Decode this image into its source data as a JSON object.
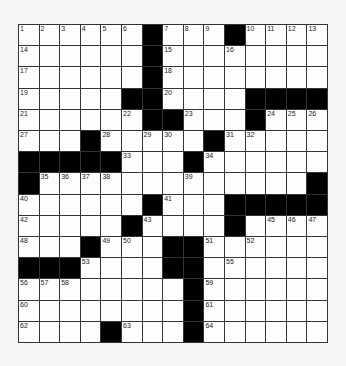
{
  "puzzle": {
    "rows": 15,
    "cols": 15,
    "layout": [
      "......#...#....",
      "......#........",
      "......#........",
      ".....##....####",
      "......##...#...",
      "...#.....#.....",
      "#####...#......",
      "#.............#",
      "......#...#####",
      ".....#....#....",
      "...#...##......",
      "###....##......",
      "........#......",
      "........#......",
      "....#...#......"
    ],
    "numbers": [
      [
        0,
        0,
        "1"
      ],
      [
        0,
        1,
        "2"
      ],
      [
        0,
        2,
        "3"
      ],
      [
        0,
        3,
        "4"
      ],
      [
        0,
        4,
        "5"
      ],
      [
        0,
        5,
        "6"
      ],
      [
        0,
        7,
        "7"
      ],
      [
        0,
        8,
        "8"
      ],
      [
        0,
        9,
        "9"
      ],
      [
        0,
        11,
        "10"
      ],
      [
        0,
        12,
        "11"
      ],
      [
        0,
        13,
        "12"
      ],
      [
        0,
        14,
        "13"
      ],
      [
        1,
        0,
        "14"
      ],
      [
        1,
        7,
        "15"
      ],
      [
        1,
        10,
        "16"
      ],
      [
        2,
        0,
        "17"
      ],
      [
        2,
        7,
        "18"
      ],
      [
        3,
        0,
        "19"
      ],
      [
        3,
        7,
        "20"
      ],
      [
        4,
        0,
        "21"
      ],
      [
        4,
        5,
        "22"
      ],
      [
        4,
        8,
        "23"
      ],
      [
        4,
        12,
        "24"
      ],
      [
        4,
        13,
        "25"
      ],
      [
        4,
        14,
        "26"
      ],
      [
        5,
        0,
        "27"
      ],
      [
        5,
        4,
        "28"
      ],
      [
        5,
        6,
        "29"
      ],
      [
        5,
        7,
        "30"
      ],
      [
        5,
        10,
        "31"
      ],
      [
        5,
        11,
        "32"
      ],
      [
        6,
        5,
        "33"
      ],
      [
        6,
        9,
        "34"
      ],
      [
        7,
        1,
        "35"
      ],
      [
        7,
        2,
        "36"
      ],
      [
        7,
        3,
        "37"
      ],
      [
        7,
        4,
        "38"
      ],
      [
        7,
        8,
        "39"
      ],
      [
        8,
        0,
        "40"
      ],
      [
        8,
        7,
        "41"
      ],
      [
        9,
        0,
        "42"
      ],
      [
        9,
        6,
        "43"
      ],
      [
        9,
        10,
        "44"
      ],
      [
        9,
        12,
        "45"
      ],
      [
        9,
        13,
        "46"
      ],
      [
        9,
        14,
        "47"
      ],
      [
        10,
        0,
        "48"
      ],
      [
        10,
        4,
        "49"
      ],
      [
        10,
        5,
        "50"
      ],
      [
        10,
        9,
        "51"
      ],
      [
        10,
        11,
        "52"
      ],
      [
        11,
        3,
        "53"
      ],
      [
        11,
        7,
        "54"
      ],
      [
        11,
        10,
        "55"
      ],
      [
        12,
        0,
        "56"
      ],
      [
        12,
        1,
        "57"
      ],
      [
        12,
        2,
        "58"
      ],
      [
        12,
        9,
        "59"
      ],
      [
        13,
        0,
        "60"
      ],
      [
        13,
        9,
        "61"
      ],
      [
        14,
        0,
        "62"
      ],
      [
        14,
        5,
        "63"
      ],
      [
        14,
        9,
        "64"
      ]
    ]
  }
}
